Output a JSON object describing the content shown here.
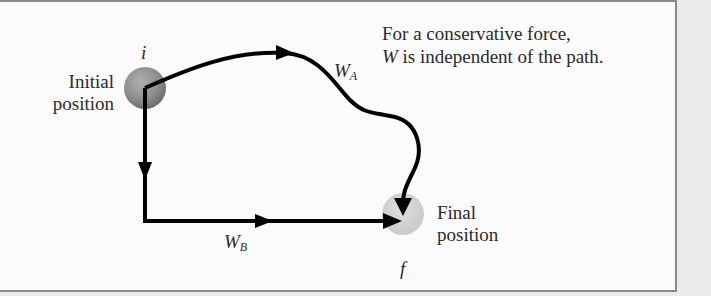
{
  "caption": {
    "line1": "For a conservative force,",
    "line2_var": "W",
    "line2_rest": " is independent of the path."
  },
  "points": {
    "initial": {
      "symbol": "i",
      "label_line1": "Initial",
      "label_line2": "position",
      "color": "#8c8c8c"
    },
    "final": {
      "symbol": "f",
      "label_line1": "Final",
      "label_line2": "position",
      "color": "#d2d2d2"
    }
  },
  "paths": [
    {
      "id": "A",
      "label_var": "W",
      "label_sub": "A",
      "shape": "curved"
    },
    {
      "id": "B",
      "label_var": "W",
      "label_sub": "B",
      "shape": "down-then-right"
    }
  ],
  "colors": {
    "background": "#ebebeb",
    "panel": "#fbfbfb",
    "border": "#8a8a8a",
    "stroke": "#000000"
  }
}
